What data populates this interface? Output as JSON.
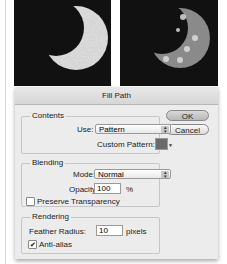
{
  "images": [
    {
      "name": "crescent-moon-textured",
      "background": "#111111"
    },
    {
      "name": "crescent-moon-pattern-fill",
      "background": "#111111"
    }
  ],
  "dialog": {
    "title": "Fill Path",
    "buttons": {
      "ok": "OK",
      "cancel": "Cancel"
    },
    "contents": {
      "title": "Contents",
      "use_label": "Use:",
      "use_value": "Pattern",
      "custom_pattern_label": "Custom Pattern:"
    },
    "blending": {
      "title": "Blending",
      "mode_label": "Mode:",
      "mode_value": "Normal",
      "opacity_label": "Opacity:",
      "opacity_value": "100",
      "opacity_unit": "%",
      "preserve_label": "Preserve Transparency",
      "preserve_checked": false
    },
    "rendering": {
      "title": "Rendering",
      "feather_label": "Feather Radius:",
      "feather_value": "10",
      "feather_unit": "pixels",
      "antialias_label": "Anti-alias",
      "antialias_checked": true
    }
  }
}
